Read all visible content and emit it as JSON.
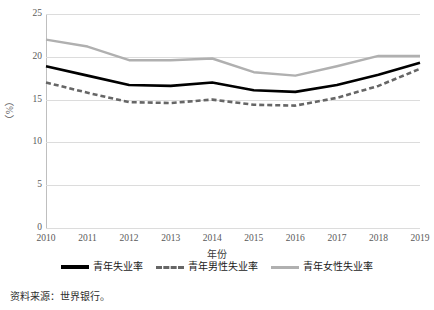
{
  "chart_data": {
    "type": "line",
    "title": "",
    "xlabel": "年份",
    "ylabel": "（%）",
    "categories": [
      "2010",
      "2011",
      "2012",
      "2013",
      "2014",
      "2015",
      "2016",
      "2017",
      "2018",
      "2019"
    ],
    "ylim": [
      0,
      25
    ],
    "yticks": [
      0,
      5,
      10,
      15,
      20,
      25
    ],
    "grid": true,
    "legend_position": "bottom",
    "series": [
      {
        "name": "青年失业率",
        "style": "solid",
        "color": "#000000",
        "values": [
          18.9,
          17.8,
          16.7,
          16.6,
          17.0,
          16.1,
          15.9,
          16.7,
          17.9,
          19.3
        ]
      },
      {
        "name": "青年男性失业率",
        "style": "dashed",
        "color": "#666666",
        "values": [
          17.0,
          15.8,
          14.7,
          14.6,
          15.0,
          14.4,
          14.3,
          15.2,
          16.6,
          18.6
        ]
      },
      {
        "name": "青年女性失业率",
        "style": "solid",
        "color": "#b0b0b0",
        "values": [
          22.0,
          21.2,
          19.6,
          19.6,
          19.8,
          18.2,
          17.8,
          18.9,
          20.1,
          20.1
        ]
      }
    ],
    "source_note": "资料来源：世界银行。"
  }
}
